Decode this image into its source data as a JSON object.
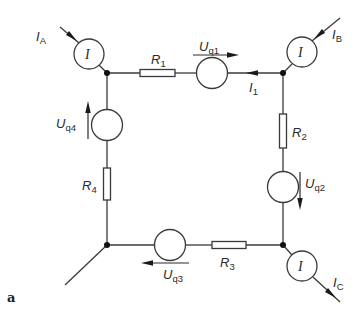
{
  "figure": {
    "label": "a",
    "type": "circuit-diagram"
  },
  "components": {
    "resistors": [
      {
        "id": "R1",
        "symbol": "R",
        "sub": "1"
      },
      {
        "id": "R2",
        "symbol": "R",
        "sub": "2"
      },
      {
        "id": "R3",
        "symbol": "R",
        "sub": "3"
      },
      {
        "id": "R4",
        "symbol": "R",
        "sub": "4"
      }
    ],
    "sources": [
      {
        "id": "Uq1",
        "symbol": "U",
        "sub": "q1",
        "direction": "right"
      },
      {
        "id": "Uq2",
        "symbol": "U",
        "sub": "q2",
        "direction": "down"
      },
      {
        "id": "Uq3",
        "symbol": "U",
        "sub": "q3",
        "direction": "left"
      },
      {
        "id": "Uq4",
        "symbol": "U",
        "sub": "q4",
        "direction": "up"
      }
    ],
    "ammeters": [
      {
        "id": "A",
        "glyph": "I",
        "current_symbol": "I",
        "current_sub": "A",
        "direction": "into-node"
      },
      {
        "id": "B",
        "glyph": "I",
        "current_symbol": "I",
        "current_sub": "B",
        "direction": "into-node"
      },
      {
        "id": "C",
        "glyph": "I",
        "current_symbol": "I",
        "current_sub": "C",
        "direction": "out-of-node"
      }
    ],
    "branch_current": {
      "symbol": "I",
      "sub": "1",
      "direction": "left"
    }
  },
  "colors": {
    "wire": "#3a3a3a",
    "node": "#111111",
    "background": "#ffffff"
  }
}
